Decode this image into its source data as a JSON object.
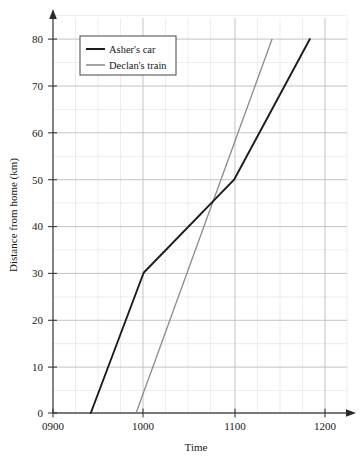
{
  "chart_data": {
    "type": "line",
    "title": "",
    "xlabel": "Time",
    "ylabel": "Distance from home (km)",
    "xlim": [
      900,
      1200
    ],
    "ylim": [
      0,
      80
    ],
    "x_ticks": [
      "0900",
      "1000",
      "1100",
      "1200"
    ],
    "y_ticks": [
      "0",
      "10",
      "20",
      "30",
      "40",
      "50",
      "60",
      "70",
      "80"
    ],
    "grid": true,
    "grid_minor": true,
    "legend_position": "top-left",
    "series": [
      {
        "name": "Asher's car",
        "color": "#1c1c1c",
        "points": [
          {
            "time": "0925",
            "distance": 0
          },
          {
            "time": "1000",
            "distance": 30
          },
          {
            "time": "1100",
            "distance": 50
          },
          {
            "time": "1150",
            "distance": 80
          }
        ]
      },
      {
        "name": "Declan's train",
        "color": "#8c8c8c",
        "points": [
          {
            "time": "0955",
            "distance": 0
          },
          {
            "time": "1125",
            "distance": 80
          }
        ]
      }
    ],
    "annotations": []
  },
  "axes": {
    "y_title": "Distance from home (km)",
    "x_title": "Time",
    "y_tick_labels": [
      "80",
      "70",
      "60",
      "50",
      "40",
      "30",
      "20",
      "10",
      "0"
    ],
    "x_tick_labels": [
      "0900",
      "1000",
      "1100",
      "1200"
    ]
  },
  "legend": {
    "items": [
      {
        "label": "Asher's car",
        "color": "#1c1c1c"
      },
      {
        "label": "Declan's train",
        "color": "#8c8c8c"
      }
    ]
  },
  "colors": {
    "car_line": "#1c1c1c",
    "train_line": "#8c8c8c",
    "axis": "#4d4d4d",
    "grid_major": "#b9b9b9",
    "grid_minor": "#dedede",
    "legend_border": "#555555",
    "background": "#ffffff"
  }
}
